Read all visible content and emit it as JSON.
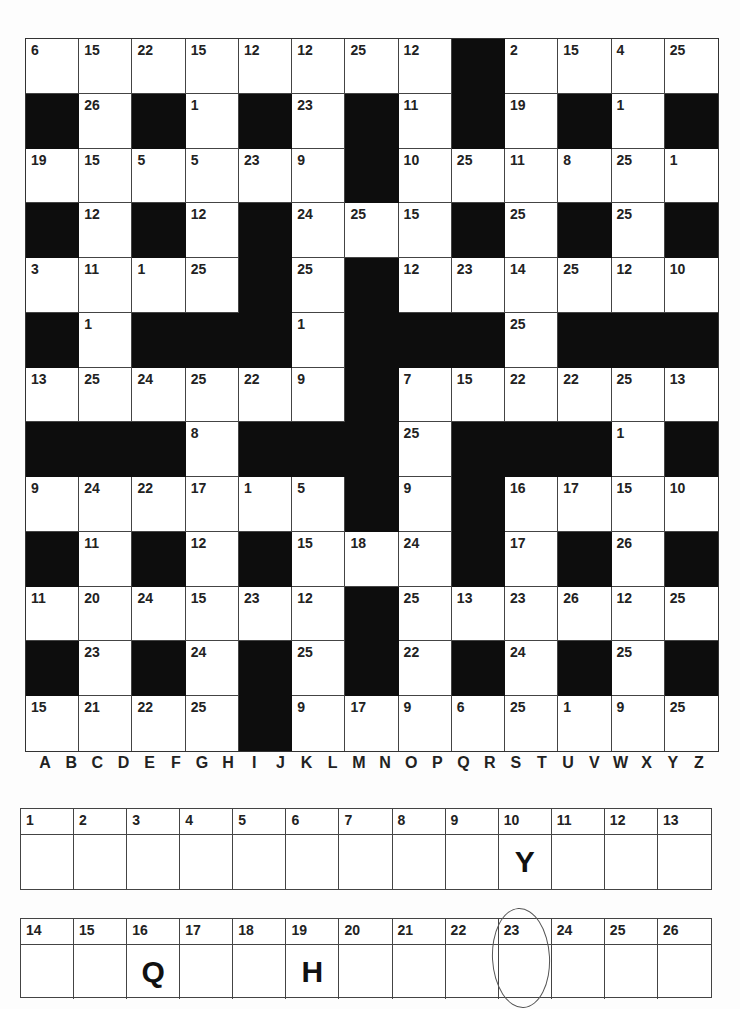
{
  "puzzle": {
    "type": "codeword",
    "rows": 13,
    "cols": 13,
    "grid": [
      [
        6,
        15,
        22,
        15,
        12,
        12,
        25,
        12,
        0,
        2,
        15,
        4,
        25
      ],
      [
        0,
        26,
        0,
        1,
        0,
        23,
        0,
        11,
        0,
        19,
        0,
        1,
        0
      ],
      [
        19,
        15,
        5,
        5,
        23,
        9,
        0,
        10,
        25,
        11,
        8,
        25,
        1
      ],
      [
        0,
        12,
        0,
        12,
        0,
        24,
        25,
        15,
        0,
        25,
        0,
        25,
        0
      ],
      [
        3,
        11,
        1,
        25,
        0,
        25,
        0,
        12,
        23,
        14,
        25,
        12,
        10
      ],
      [
        0,
        1,
        0,
        0,
        0,
        1,
        0,
        0,
        0,
        25,
        0,
        0,
        0
      ],
      [
        13,
        25,
        24,
        25,
        22,
        9,
        0,
        7,
        15,
        22,
        22,
        25,
        13
      ],
      [
        0,
        0,
        0,
        8,
        0,
        0,
        0,
        25,
        0,
        0,
        0,
        1,
        0
      ],
      [
        9,
        24,
        22,
        17,
        1,
        5,
        0,
        9,
        0,
        16,
        17,
        15,
        10
      ],
      [
        0,
        11,
        0,
        12,
        0,
        15,
        18,
        24,
        0,
        17,
        0,
        26,
        0
      ],
      [
        11,
        20,
        24,
        15,
        23,
        12,
        0,
        25,
        13,
        23,
        26,
        12,
        25
      ],
      [
        0,
        23,
        0,
        24,
        0,
        25,
        0,
        22,
        0,
        24,
        0,
        25,
        0
      ],
      [
        15,
        21,
        22,
        25,
        0,
        9,
        17,
        9,
        6,
        25,
        1,
        9,
        25
      ]
    ],
    "black_cell_value": 0
  },
  "alphabet": [
    "A",
    "B",
    "C",
    "D",
    "E",
    "F",
    "G",
    "H",
    "I",
    "J",
    "K",
    "L",
    "M",
    "N",
    "O",
    "P",
    "Q",
    "R",
    "S",
    "T",
    "U",
    "V",
    "W",
    "X",
    "Y",
    "Z"
  ],
  "key": {
    "row1": [
      {
        "num": "1",
        "letter": ""
      },
      {
        "num": "2",
        "letter": ""
      },
      {
        "num": "3",
        "letter": ""
      },
      {
        "num": "4",
        "letter": ""
      },
      {
        "num": "5",
        "letter": ""
      },
      {
        "num": "6",
        "letter": ""
      },
      {
        "num": "7",
        "letter": ""
      },
      {
        "num": "8",
        "letter": ""
      },
      {
        "num": "9",
        "letter": ""
      },
      {
        "num": "10",
        "letter": "Y"
      },
      {
        "num": "11",
        "letter": ""
      },
      {
        "num": "12",
        "letter": ""
      },
      {
        "num": "13",
        "letter": ""
      }
    ],
    "row2": [
      {
        "num": "14",
        "letter": ""
      },
      {
        "num": "15",
        "letter": ""
      },
      {
        "num": "16",
        "letter": "Q"
      },
      {
        "num": "17",
        "letter": ""
      },
      {
        "num": "18",
        "letter": ""
      },
      {
        "num": "19",
        "letter": "H"
      },
      {
        "num": "20",
        "letter": ""
      },
      {
        "num": "21",
        "letter": ""
      },
      {
        "num": "22",
        "letter": ""
      },
      {
        "num": "23",
        "letter": ""
      },
      {
        "num": "24",
        "letter": ""
      },
      {
        "num": "25",
        "letter": ""
      },
      {
        "num": "26",
        "letter": ""
      }
    ]
  },
  "annotations": {
    "circled_key_number": "23"
  }
}
